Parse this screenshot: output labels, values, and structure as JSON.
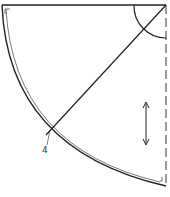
{
  "diagram": {
    "type": "pattern-piece",
    "labels": {
      "point_4": "4"
    },
    "colors": {
      "stroke": "#222222",
      "background": "#ffffff"
    }
  }
}
